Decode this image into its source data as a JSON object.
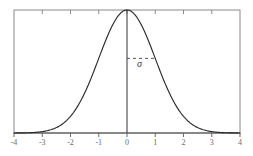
{
  "figure": {
    "title": "",
    "background_color": "#ffffff",
    "frame_color": "#7a7a7a",
    "curve_color": "#2b2b2b",
    "axis_color": "#4a4a4a",
    "dash_color": "#555555",
    "label_color": "#6b6b6b"
  },
  "annotations": {
    "sigma_symbol": "σ"
  },
  "chart_data": {
    "type": "line",
    "title": "",
    "xlabel": "",
    "ylabel": "",
    "xlim": [
      -4,
      4
    ],
    "ylim": [
      0,
      0.42
    ],
    "grid": false,
    "legend": null,
    "xticks": [
      -4,
      -3,
      -2,
      -1,
      0,
      1,
      2,
      3,
      4
    ],
    "xtick_labels": [
      "-4",
      "-3",
      "-2",
      "-1",
      "0",
      "1",
      "2",
      "3",
      "4"
    ],
    "yticks": [],
    "ytick_labels": [],
    "series": [
      {
        "name": "standard-normal-pdf",
        "description": "Gaussian probability density, mean 0, standard deviation 1",
        "mean": 0,
        "sigma": 1,
        "peak_value": 0.3989,
        "x": [
          -4.0,
          -3.8,
          -3.6,
          -3.4,
          -3.2,
          -3.0,
          -2.8,
          -2.6,
          -2.4,
          -2.2,
          -2.0,
          -1.8,
          -1.6,
          -1.4,
          -1.2,
          -1.0,
          -0.8,
          -0.6,
          -0.4,
          -0.2,
          0.0,
          0.2,
          0.4,
          0.6,
          0.8,
          1.0,
          1.2,
          1.4,
          1.6,
          1.8,
          2.0,
          2.2,
          2.4,
          2.6,
          2.8,
          3.0,
          3.2,
          3.4,
          3.6,
          3.8,
          4.0
        ],
        "y": [
          0.0001,
          0.0003,
          0.0006,
          0.0012,
          0.0024,
          0.0044,
          0.0079,
          0.0136,
          0.0224,
          0.0355,
          0.054,
          0.079,
          0.1109,
          0.1497,
          0.1942,
          0.242,
          0.2897,
          0.3332,
          0.3683,
          0.391,
          0.3989,
          0.391,
          0.3683,
          0.3332,
          0.2897,
          0.242,
          0.1942,
          0.1497,
          0.1109,
          0.079,
          0.054,
          0.0355,
          0.0224,
          0.0136,
          0.0079,
          0.0044,
          0.0024,
          0.0012,
          0.0006,
          0.0003,
          0.0001
        ]
      }
    ],
    "annotations": [
      {
        "name": "sigma-marker",
        "label": "σ",
        "type": "dashed-horizontal-span",
        "x_from": 0,
        "x_to": 1,
        "y": 0.242
      },
      {
        "name": "mean-line",
        "type": "vertical-line",
        "x": 0,
        "y_from": 0,
        "y_to": 0.3989
      }
    ]
  }
}
